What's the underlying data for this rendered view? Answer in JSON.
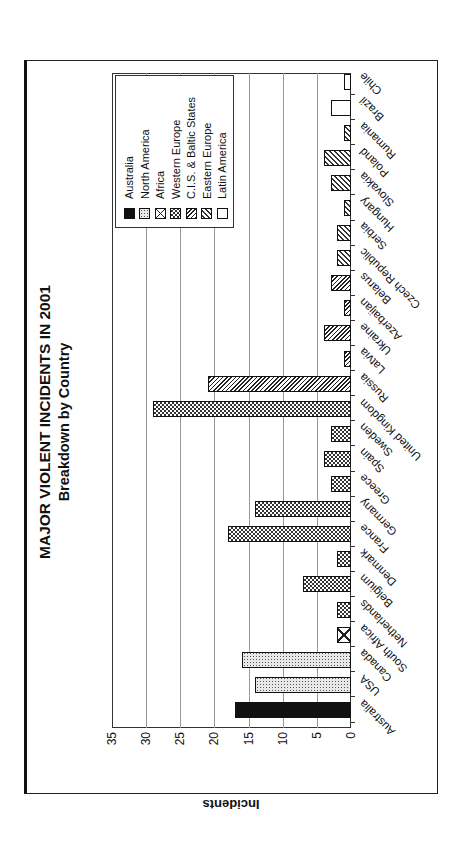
{
  "chart_data": {
    "type": "bar",
    "title": "MAJOR VIOLENT INCIDENTS IN 2001",
    "subtitle": "Breakdown by Country",
    "xlabel": "",
    "ylabel": "Incidents",
    "ylim": [
      0,
      35
    ],
    "yticks": [
      0,
      5,
      10,
      15,
      20,
      25,
      30,
      35
    ],
    "grid": true,
    "orientation": "rotated 90 degrees (page rotated counter-clockwise)",
    "legend_position": "upper right",
    "legend": [
      "Australia",
      "North America",
      "Africa",
      "Western Europe",
      "C.I.S. & Baltic States",
      "Eastern Europe",
      "Latin America"
    ],
    "categories": [
      "Australia",
      "USA",
      "Canada",
      "South Africa",
      "Netherlands",
      "Belgium",
      "Denmark",
      "France",
      "Germany",
      "Greece",
      "Spain",
      "Sweden",
      "United Kingdom",
      "Russia",
      "Latvia",
      "Ukraine",
      "Azerbaijan",
      "Belarus",
      "Czech Republic",
      "Serbia",
      "Hungary",
      "Slovakia",
      "Poland",
      "Rumania",
      "Brazil",
      "Chile"
    ],
    "values": [
      17,
      14,
      16,
      2,
      2,
      7,
      2,
      18,
      14,
      3,
      4,
      3,
      29,
      21,
      1,
      4,
      1,
      3,
      2,
      2,
      1,
      3,
      4,
      1,
      3,
      1
    ],
    "regions": [
      "Australia",
      "North America",
      "North America",
      "Africa",
      "Western Europe",
      "Western Europe",
      "Western Europe",
      "Western Europe",
      "Western Europe",
      "Western Europe",
      "Western Europe",
      "Western Europe",
      "Western Europe",
      "C.I.S. & Baltic States",
      "C.I.S. & Baltic States",
      "C.I.S. & Baltic States",
      "C.I.S. & Baltic States",
      "C.I.S. & Baltic States",
      "Eastern Europe",
      "Eastern Europe",
      "Eastern Europe",
      "Eastern Europe",
      "Eastern Europe",
      "Eastern Europe",
      "Latin America",
      "Latin America"
    ]
  },
  "legend_items": [
    {
      "label": "Australia",
      "pattern": "p-australia"
    },
    {
      "label": "North America",
      "pattern": "p-north-america"
    },
    {
      "label": "Africa",
      "pattern": "p-africa"
    },
    {
      "label": "Western Europe",
      "pattern": "p-western-europe"
    },
    {
      "label": "C.I.S. & Baltic States",
      "pattern": "p-cis"
    },
    {
      "label": "Eastern Europe",
      "pattern": "p-eastern-europe"
    },
    {
      "label": "Latin America",
      "pattern": "p-latin-america"
    }
  ],
  "colors": {
    "bar_outline": "#111111",
    "grid": "#999999",
    "background": "#ffffff"
  }
}
